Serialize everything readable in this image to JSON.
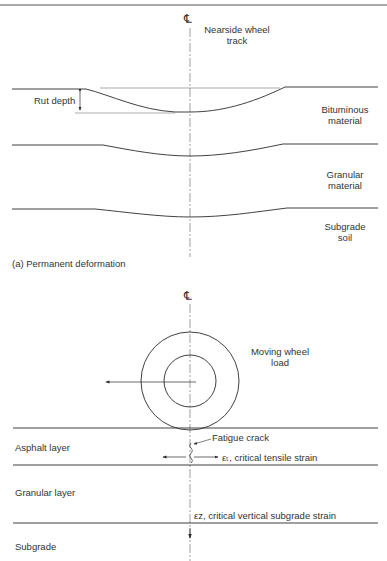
{
  "panel_a": {
    "centerline_symbol": "℄",
    "wheel_track_label": [
      "Nearside wheel",
      "track"
    ],
    "rut_depth_label": "Rut depth",
    "layers": [
      {
        "name": "bituminous",
        "label": [
          "Bituminous",
          "material"
        ]
      },
      {
        "name": "granular",
        "label": [
          "Granular",
          "material"
        ]
      },
      {
        "name": "subgrade",
        "label": [
          "Subgrade",
          "soil"
        ]
      }
    ],
    "caption": "(a) Permanent deformation"
  },
  "panel_b": {
    "centerline_symbol": "℄",
    "wheel_label": [
      "Moving wheel",
      "load"
    ],
    "layers": [
      {
        "name": "asphalt",
        "label": "Asphalt layer"
      },
      {
        "name": "granular",
        "label": "Granular layer"
      },
      {
        "name": "subgrade",
        "label": "Subgrade"
      }
    ],
    "fatigue_crack_label": "Fatigue crack",
    "tensile_strain_label": "εₜ, critical tensile strain",
    "vertical_strain_label": "εz, critical vertical subgrade strain"
  },
  "colors": {
    "line": "#2b2b2b",
    "text": "#333333"
  }
}
